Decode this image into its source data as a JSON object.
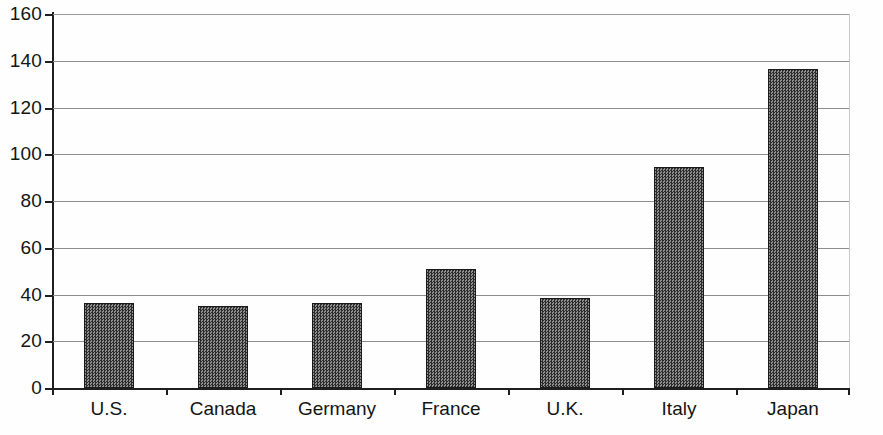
{
  "chart_data": {
    "type": "bar",
    "title": "",
    "subtitle": "",
    "xlabel": "",
    "ylabel": "",
    "categories": [
      "U.S.",
      "Canada",
      "Germany",
      "France",
      "U.K.",
      "Italy",
      "Japan"
    ],
    "values": [
      36.5,
      35,
      36.5,
      51,
      38.5,
      94.5,
      136.5
    ],
    "ylim": [
      0,
      160
    ],
    "yticks": [
      0,
      20,
      40,
      60,
      80,
      100,
      120,
      140,
      160
    ],
    "ytick_labels": [
      "0",
      "20",
      "40",
      "60",
      "80",
      "100",
      "120",
      "140",
      "160"
    ],
    "grid": true,
    "grid_axis": "y",
    "legend": false,
    "legend_position": "none",
    "bar_color": "#5a5a5a",
    "bar_edge_color": "#1a1a1a",
    "axis_color": "#1f1f1f",
    "grid_color": "#8d8d8d",
    "background_color": "#ffffff"
  },
  "caption": {
    "fragment": ""
  }
}
